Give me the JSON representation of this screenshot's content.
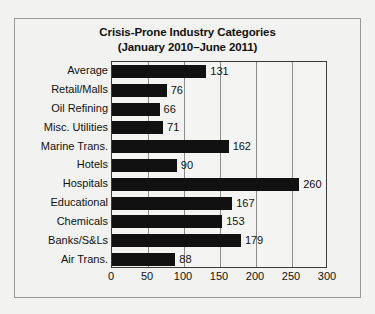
{
  "chart_data": {
    "type": "bar",
    "orientation": "horizontal",
    "title": "Crisis-Prone Industry Categories",
    "subtitle": "(January 2010–June 2011)",
    "xlabel": "",
    "ylabel": "",
    "xlim": [
      0,
      300
    ],
    "xticks": [
      "0",
      "50",
      "100",
      "150",
      "200",
      "250",
      "300"
    ],
    "grid": "vertical",
    "legend": "none",
    "bar_color": "#111111",
    "background_color": "#f2f2f0",
    "categories": [
      "Average",
      "Retail/Malls",
      "Oil Refining",
      "Misc. Utilities",
      "Marine Trans.",
      "Hotels",
      "Hospitals",
      "Educational",
      "Chemicals",
      "Banks/S&Ls",
      "Air Trans."
    ],
    "values": [
      131,
      76,
      66,
      71,
      162,
      90,
      260,
      167,
      153,
      179,
      88
    ],
    "value_labels": [
      "131",
      "76",
      "66",
      "71",
      "162",
      "90",
      "260",
      "167",
      "153",
      "179",
      "88"
    ]
  }
}
